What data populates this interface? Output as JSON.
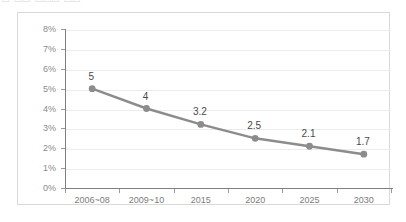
{
  "caption": {
    "truncated_text": "□ □□ □□□ □□"
  },
  "colors": {
    "series_line": "#8c8c8c",
    "marker": "#8c8c8c",
    "gridline": "#ececec",
    "axis": "#808080",
    "frame_border": "#d9d9d9",
    "tick_label": "#8a8a8a",
    "data_label": "#4a4a4a",
    "background": "#ffffff"
  },
  "chart_data": {
    "type": "line",
    "title": "",
    "xlabel": "",
    "ylabel": "",
    "categories": [
      "2006~08",
      "2009~10",
      "2015",
      "2020",
      "2025",
      "2030"
    ],
    "values": [
      5,
      4,
      3.2,
      2.5,
      2.1,
      1.7
    ],
    "point_labels": [
      "5",
      "4",
      "3.2",
      "2.5",
      "2.1",
      "1.7"
    ],
    "value_unit": "%",
    "ylim": [
      0,
      8
    ],
    "ytick_values": [
      0,
      1,
      2,
      3,
      4,
      5,
      6,
      7,
      8
    ],
    "ytick_labels": [
      "0%",
      "1%",
      "2%",
      "3%",
      "4%",
      "5%",
      "6%",
      "7%",
      "8%"
    ],
    "grid": true,
    "grid_axis": "y",
    "legend": false,
    "legend_position": "none",
    "marker": "circle",
    "series": [
      {
        "name": "",
        "values": [
          5,
          4,
          3.2,
          2.5,
          2.1,
          1.7
        ]
      }
    ]
  }
}
